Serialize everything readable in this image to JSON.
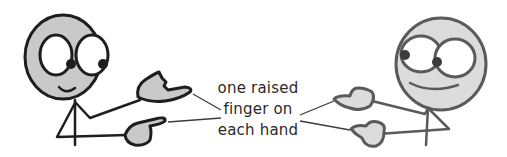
{
  "illustration": {
    "title": "Two stick figures each raising one finger on each hand",
    "callout": {
      "lines": [
        "one raised",
        "finger on",
        "each hand"
      ]
    },
    "colors": {
      "left_outline": "#1e1e1e",
      "left_fill": "#c9c9c9",
      "right_outline": "#5a5a5a",
      "right_fill": "#dcdcdc",
      "leader_line": "#3c3c3c",
      "text": "#2a2a2a",
      "background": "#ffffff"
    },
    "figures": [
      {
        "name": "left-figure",
        "hands": [
          "upper-hand",
          "lower-hand"
        ],
        "facing": "right"
      },
      {
        "name": "right-figure",
        "hands": [
          "upper-hand",
          "lower-hand"
        ],
        "facing": "left"
      }
    ]
  }
}
